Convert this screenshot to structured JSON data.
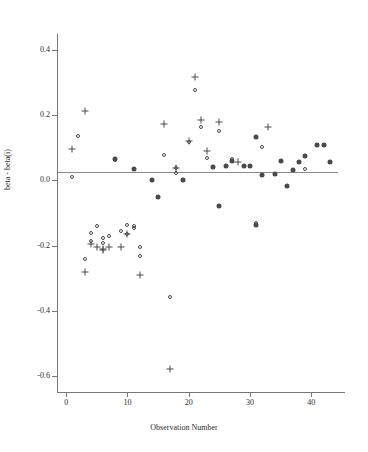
{
  "chart_data": {
    "type": "scatter",
    "title": "",
    "xlabel": "Observation Number",
    "ylabel": "beta - beta(i)",
    "xlim": [
      -1.5,
      45.5
    ],
    "ylim": [
      -0.65,
      0.45
    ],
    "xticks": [
      0,
      10,
      20,
      30,
      40
    ],
    "xtick_labels": [
      "0",
      "10",
      "20",
      "30",
      "40"
    ],
    "yticks": [
      0.4,
      0.2,
      0.0,
      -0.2,
      -0.4,
      -0.6
    ],
    "ytick_labels": [
      "0.4",
      "0.2",
      "0.0",
      "-0.2",
      "-0.4",
      "-0.6"
    ],
    "grid": false,
    "legend": "none",
    "reference_line_y": 0.0,
    "series": [
      {
        "name": "circle-series",
        "marker": "circle",
        "points": [
          {
            "x": 1,
            "y": 0.012
          },
          {
            "x": 2,
            "y": 0.136
          },
          {
            "x": 8,
            "y": 0.064
          },
          {
            "x": 16,
            "y": 0.079
          },
          {
            "x": 18,
            "y": 0.023
          },
          {
            "x": 18,
            "y": 0.037
          },
          {
            "x": 19,
            "y": 0.0
          },
          {
            "x": 20,
            "y": 0.118
          },
          {
            "x": 21,
            "y": 0.279
          },
          {
            "x": 22,
            "y": 0.163
          },
          {
            "x": 23,
            "y": 0.069
          },
          {
            "x": 25,
            "y": 0.152
          },
          {
            "x": 27,
            "y": 0.067
          },
          {
            "x": 32,
            "y": 0.104
          },
          {
            "x": 39,
            "y": 0.036
          },
          {
            "x": 4,
            "y": -0.185
          },
          {
            "x": 4,
            "y": -0.162
          },
          {
            "x": 5,
            "y": -0.141
          },
          {
            "x": 6,
            "y": -0.192
          },
          {
            "x": 6,
            "y": -0.178
          },
          {
            "x": 7,
            "y": -0.171
          },
          {
            "x": 9,
            "y": -0.155
          },
          {
            "x": 10,
            "y": -0.138
          },
          {
            "x": 10,
            "y": -0.163
          },
          {
            "x": 11,
            "y": -0.139
          },
          {
            "x": 11,
            "y": -0.147
          },
          {
            "x": 12,
            "y": -0.203
          },
          {
            "x": 12,
            "y": -0.232
          },
          {
            "x": 3,
            "y": -0.241
          },
          {
            "x": 17,
            "y": -0.357
          },
          {
            "x": 31,
            "y": -0.131
          }
        ]
      },
      {
        "name": "plus-series",
        "marker": "plus",
        "points": [
          {
            "x": 1,
            "y": 0.098
          },
          {
            "x": 3,
            "y": 0.214
          },
          {
            "x": 16,
            "y": 0.174
          },
          {
            "x": 18,
            "y": 0.037
          },
          {
            "x": 20,
            "y": 0.122
          },
          {
            "x": 21,
            "y": 0.319
          },
          {
            "x": 22,
            "y": 0.186
          },
          {
            "x": 23,
            "y": 0.092
          },
          {
            "x": 25,
            "y": 0.181
          },
          {
            "x": 28,
            "y": 0.057
          },
          {
            "x": 33,
            "y": 0.163
          },
          {
            "x": 4,
            "y": -0.195
          },
          {
            "x": 5,
            "y": -0.206
          },
          {
            "x": 6,
            "y": -0.211
          },
          {
            "x": 6,
            "y": -0.213
          },
          {
            "x": 7,
            "y": -0.204
          },
          {
            "x": 9,
            "y": -0.205
          },
          {
            "x": 10,
            "y": -0.163
          },
          {
            "x": 12,
            "y": -0.29
          },
          {
            "x": 3,
            "y": -0.281
          },
          {
            "x": 17,
            "y": -0.578
          }
        ]
      },
      {
        "name": "filled-series",
        "marker": "filled",
        "points": [
          {
            "x": 8,
            "y": 0.066
          },
          {
            "x": 11,
            "y": 0.036
          },
          {
            "x": 14,
            "y": 0.0
          },
          {
            "x": 19,
            "y": 0.0
          },
          {
            "x": 24,
            "y": 0.04
          },
          {
            "x": 26,
            "y": 0.043
          },
          {
            "x": 27,
            "y": 0.059
          },
          {
            "x": 29,
            "y": 0.043
          },
          {
            "x": 30,
            "y": 0.043
          },
          {
            "x": 31,
            "y": 0.134
          },
          {
            "x": 32,
            "y": 0.016
          },
          {
            "x": 34,
            "y": 0.019
          },
          {
            "x": 35,
            "y": 0.059
          },
          {
            "x": 36,
            "y": -0.016
          },
          {
            "x": 37,
            "y": 0.031
          },
          {
            "x": 38,
            "y": 0.058
          },
          {
            "x": 39,
            "y": 0.076
          },
          {
            "x": 41,
            "y": 0.11
          },
          {
            "x": 42,
            "y": 0.11
          },
          {
            "x": 43,
            "y": 0.058
          },
          {
            "x": 15,
            "y": -0.052
          },
          {
            "x": 25,
            "y": -0.079
          },
          {
            "x": 31,
            "y": -0.136
          }
        ]
      }
    ]
  }
}
